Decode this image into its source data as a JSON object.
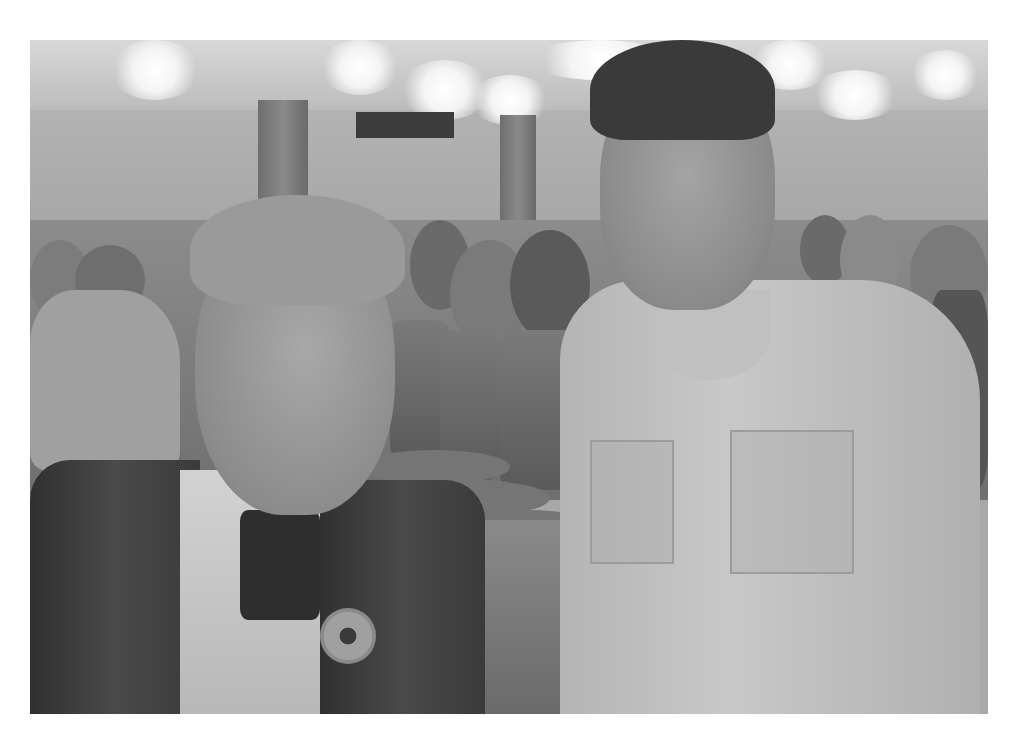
{
  "image": {
    "type": "photograph",
    "color_mode": "grayscale",
    "scene": "two people posing in a large event hall with seated crowd in background",
    "frame": {
      "left": 30,
      "top": 40,
      "width": 958,
      "height": 674,
      "border_color": "#ffffff"
    },
    "subjects": [
      {
        "position": "left",
        "description": "young man in dark blazer with light collared shirt and round pin badge"
      },
      {
        "position": "right",
        "description": "boy with dark hair wearing light button-up shirt with chest pocket"
      }
    ],
    "palette": {
      "highlight": "#f4f4f4",
      "midtone": "#a0a0a0",
      "shadow": "#3a3a3a"
    }
  }
}
